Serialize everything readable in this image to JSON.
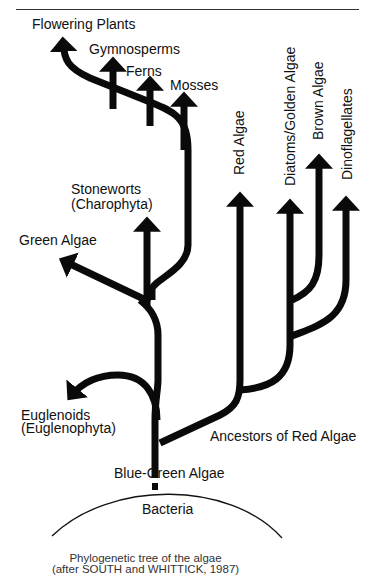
{
  "diagram": {
    "type": "phylogenetic-tree",
    "labels": {
      "flowering_plants": "Flowering Plants",
      "gymnosperms": "Gymnosperms",
      "ferns": "Ferns",
      "mosses": "Mosses",
      "stoneworts_1": "Stoneworts",
      "stoneworts_2": "(Charophyta)",
      "green_algae": "Green Algae",
      "euglenoids_1": "Euglenoids",
      "euglenoids_2": "(Euglenophyta)",
      "red_algae": "Red Algae",
      "diatoms": "Diatoms/Golden Algae",
      "brown_algae": "Brown Algae",
      "dinoflagellates": "Dinoflagellates",
      "ancestors_red": "Ancestors of Red Algae",
      "blue_green": "Blue-Green Algae",
      "bacteria": "Bacteria"
    },
    "caption": {
      "line1": "Phylogenetic tree of the algae",
      "line2": "(after SOUTH and WHITTICK, 1987)"
    },
    "colors": {
      "branch": "#0a0a0a",
      "text": "#111111"
    }
  }
}
